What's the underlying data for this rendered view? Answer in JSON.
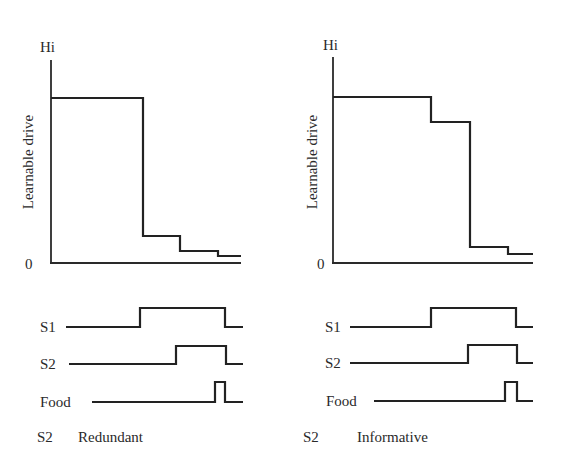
{
  "panels": [
    {
      "id": "redundant",
      "y_axis": {
        "label": "Learnable drive",
        "top_label": "Hi",
        "bottom_label": "0"
      },
      "drive_curve": [
        [
          51,
          98
        ],
        [
          143,
          98
        ],
        [
          143,
          236
        ],
        [
          180,
          236
        ],
        [
          180,
          251
        ],
        [
          218,
          251
        ],
        [
          218,
          256
        ],
        [
          241,
          256
        ]
      ],
      "timing": [
        {
          "label": "S1",
          "points": [
            [
              66,
              327
            ],
            [
              140,
              327
            ],
            [
              140,
              308
            ],
            [
              225,
              308
            ],
            [
              225,
              327
            ],
            [
              243,
              327
            ]
          ]
        },
        {
          "label": "S2",
          "points": [
            [
              69,
              364
            ],
            [
              176,
              364
            ],
            [
              176,
              346
            ],
            [
              226,
              346
            ],
            [
              226,
              364
            ],
            [
              243,
              364
            ]
          ]
        },
        {
          "label": "Food",
          "points": [
            [
              92,
              402
            ],
            [
              215,
              402
            ],
            [
              215,
              382
            ],
            [
              225,
              382
            ],
            [
              225,
              402
            ],
            [
              243,
              402
            ]
          ]
        }
      ],
      "caption": {
        "stimulus": "S2",
        "condition": "Redundant"
      }
    },
    {
      "id": "informative",
      "y_axis": {
        "label": "Learnable drive",
        "top_label": "Hi",
        "bottom_label": "0"
      },
      "drive_curve": [
        [
          333,
          97
        ],
        [
          431,
          97
        ],
        [
          431,
          122
        ],
        [
          470,
          122
        ],
        [
          470,
          247
        ],
        [
          508,
          247
        ],
        [
          508,
          254
        ],
        [
          533,
          254
        ]
      ],
      "timing": [
        {
          "label": "S1",
          "points": [
            [
              350,
              327
            ],
            [
              431,
              327
            ],
            [
              431,
              308
            ],
            [
              516,
              308
            ],
            [
              516,
              327
            ],
            [
              533,
              327
            ]
          ]
        },
        {
          "label": "S2",
          "points": [
            [
              350,
              363
            ],
            [
              468,
              363
            ],
            [
              468,
              345
            ],
            [
              517,
              345
            ],
            [
              517,
              363
            ],
            [
              533,
              363
            ]
          ]
        },
        {
          "label": "Food",
          "points": [
            [
              374,
              401
            ],
            [
              505,
              401
            ],
            [
              505,
              382
            ],
            [
              517,
              382
            ],
            [
              517,
              401
            ],
            [
              533,
              401
            ]
          ]
        }
      ],
      "caption": {
        "stimulus": "S2",
        "condition": "Informative"
      }
    }
  ],
  "colors": {
    "ink": "#222222",
    "background": "#ffffff"
  }
}
